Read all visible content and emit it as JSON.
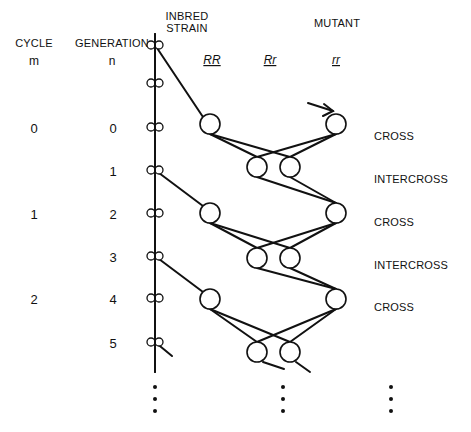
{
  "headers": {
    "cycle": {
      "label": "CYCLE",
      "var": "m"
    },
    "generation": {
      "label": "GENERATION",
      "var": "n"
    },
    "inbred_strain": {
      "line1": "INBRED",
      "line2": "STRAIN"
    },
    "mutant": "MUTANT",
    "genotypes": [
      "RR",
      "Rr",
      "rr"
    ]
  },
  "cycles": [
    {
      "value": "0",
      "y": 128
    },
    {
      "value": "1",
      "y": 214
    },
    {
      "value": "2",
      "y": 299
    }
  ],
  "generations": [
    {
      "value": "0",
      "y": 128
    },
    {
      "value": "1",
      "y": 171
    },
    {
      "value": "2",
      "y": 214
    },
    {
      "value": "3",
      "y": 257
    },
    {
      "value": "4",
      "y": 299
    },
    {
      "value": "5",
      "y": 343
    }
  ],
  "steps": [
    {
      "label": "CROSS",
      "y": 136
    },
    {
      "label": "INTERCROSS",
      "y": 179
    },
    {
      "label": "CROSS",
      "y": 222
    },
    {
      "label": "INTERCROSS",
      "y": 265
    },
    {
      "label": "CROSS",
      "y": 307
    }
  ],
  "strain_line": {
    "x": 155,
    "y1": 34,
    "y2": 372
  },
  "mini_pairs_y": [
    45,
    83,
    127,
    170,
    213,
    256,
    298,
    342
  ],
  "circles": {
    "radius": 10,
    "RR_x": 210,
    "Rr_left_x": 257,
    "Rr_right_x": 290,
    "rr_x": 336,
    "cross_rows_y": [
      124,
      213,
      299
    ],
    "intercross_rows_y": [
      167,
      258,
      352
    ]
  },
  "lines": [
    {
      "x1": 155,
      "y1": 45,
      "x2": 203,
      "y2": 117
    },
    {
      "x1": 155,
      "y1": 170,
      "x2": 203,
      "y2": 206
    },
    {
      "x1": 155,
      "y1": 256,
      "x2": 203,
      "y2": 292
    },
    {
      "x1": 155,
      "y1": 342,
      "x2": 172,
      "y2": 356
    },
    {
      "x1": 210,
      "y1": 134,
      "x2": 290,
      "y2": 157
    },
    {
      "x1": 210,
      "y1": 134,
      "x2": 257,
      "y2": 157
    },
    {
      "x1": 336,
      "y1": 134,
      "x2": 257,
      "y2": 157
    },
    {
      "x1": 336,
      "y1": 134,
      "x2": 290,
      "y2": 157
    },
    {
      "x1": 257,
      "y1": 177,
      "x2": 336,
      "y2": 203
    },
    {
      "x1": 290,
      "y1": 177,
      "x2": 336,
      "y2": 203
    },
    {
      "x1": 210,
      "y1": 223,
      "x2": 290,
      "y2": 248
    },
    {
      "x1": 210,
      "y1": 223,
      "x2": 257,
      "y2": 248
    },
    {
      "x1": 336,
      "y1": 223,
      "x2": 257,
      "y2": 248
    },
    {
      "x1": 336,
      "y1": 223,
      "x2": 290,
      "y2": 248
    },
    {
      "x1": 257,
      "y1": 268,
      "x2": 336,
      "y2": 289
    },
    {
      "x1": 290,
      "y1": 268,
      "x2": 336,
      "y2": 289
    },
    {
      "x1": 210,
      "y1": 309,
      "x2": 290,
      "y2": 342
    },
    {
      "x1": 210,
      "y1": 309,
      "x2": 257,
      "y2": 342
    },
    {
      "x1": 336,
      "y1": 309,
      "x2": 257,
      "y2": 342
    },
    {
      "x1": 336,
      "y1": 309,
      "x2": 290,
      "y2": 342
    },
    {
      "x1": 263,
      "y1": 362,
      "x2": 284,
      "y2": 369
    },
    {
      "x1": 296,
      "y1": 362,
      "x2": 310,
      "y2": 372
    }
  ],
  "entry_arrow": {
    "x1": 308,
    "y1": 103,
    "x2": 333,
    "y2": 111,
    "head": "324,104 333,111 323,116"
  },
  "ellipsis_columns": [
    {
      "x": 155,
      "ys": [
        387,
        399,
        411
      ]
    },
    {
      "x": 283,
      "ys": [
        387,
        399,
        411
      ]
    },
    {
      "x": 391,
      "ys": [
        387,
        399,
        411
      ]
    }
  ]
}
